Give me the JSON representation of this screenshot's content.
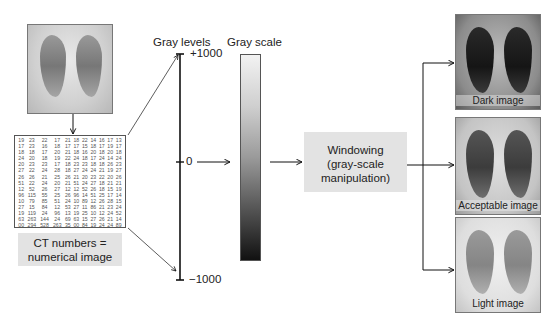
{
  "source_image": {
    "name": "chest-xray-original",
    "style": "normal"
  },
  "matrix": {
    "rows": [
      [
        "19",
        "23",
        "22",
        "17",
        "21",
        "18",
        "22",
        "14",
        "16",
        "17",
        "13"
      ],
      [
        "17",
        "23",
        "16",
        "18",
        "17",
        "17",
        "15",
        "18",
        "17",
        "19",
        "17"
      ],
      [
        "18",
        "18",
        "17",
        "20",
        "21",
        "18",
        "16",
        "20",
        "18",
        "20",
        "18"
      ],
      [
        "24",
        "20",
        "18",
        "19",
        "22",
        "24",
        "18",
        "17",
        "24",
        "14",
        "24"
      ],
      [
        "20",
        "23",
        "23",
        "17",
        "18",
        "23",
        "23",
        "18",
        "18",
        "26",
        "23"
      ],
      [
        "27",
        "22",
        "24",
        "28",
        "18",
        "27",
        "24",
        "24",
        "21",
        "19",
        "27"
      ],
      [
        "26",
        "26",
        "21",
        "25",
        "26",
        "21",
        "20",
        "23",
        "22",
        "20",
        "26"
      ],
      [
        "51",
        "22",
        "24",
        "20",
        "21",
        "51",
        "24",
        "27",
        "18",
        "21",
        "21"
      ],
      [
        "12",
        "52",
        "26",
        "27",
        "12",
        "12",
        "52",
        "26",
        "18",
        "15",
        "19"
      ],
      [
        "96",
        "115",
        "55",
        "25",
        "26",
        "96",
        "14",
        "51",
        "25",
        "17",
        "14"
      ],
      [
        "10",
        "79",
        "85",
        "51",
        "24",
        "10",
        "89",
        "12",
        "26",
        "28",
        "15"
      ],
      [
        "27",
        "15",
        "84",
        "12",
        "53",
        "27",
        "11",
        "86",
        "21",
        "23",
        "24"
      ],
      [
        "19",
        "119",
        "24",
        "96",
        "13",
        "19",
        "25",
        "10",
        "12",
        "24",
        "52"
      ],
      [
        "63",
        "263",
        "144",
        "24",
        "69",
        "63",
        "15",
        "27",
        "26",
        "21",
        "14"
      ],
      [
        "00",
        "294",
        "528",
        "263",
        "35",
        "00",
        "84",
        "19",
        "24",
        "24",
        "89"
      ]
    ]
  },
  "ct_caption": {
    "line1": "CT numbers =",
    "line2": "numerical image"
  },
  "gray_levels": {
    "title": "Gray levels",
    "max_label": "+1000",
    "mid_label": "0",
    "min_label": "−1000"
  },
  "gray_scale": {
    "title": "Gray scale",
    "top_color": "#f2f2f2",
    "bottom_color": "#111111"
  },
  "windowing": {
    "line1": "Windowing",
    "line2": "(gray-scale",
    "line3": "manipulation)"
  },
  "outputs": [
    {
      "label": "Dark image"
    },
    {
      "label": "Acceptable image"
    },
    {
      "label": "Light image"
    }
  ],
  "colors": {
    "box_fill": "#e3e3e3",
    "line": "#111111"
  }
}
